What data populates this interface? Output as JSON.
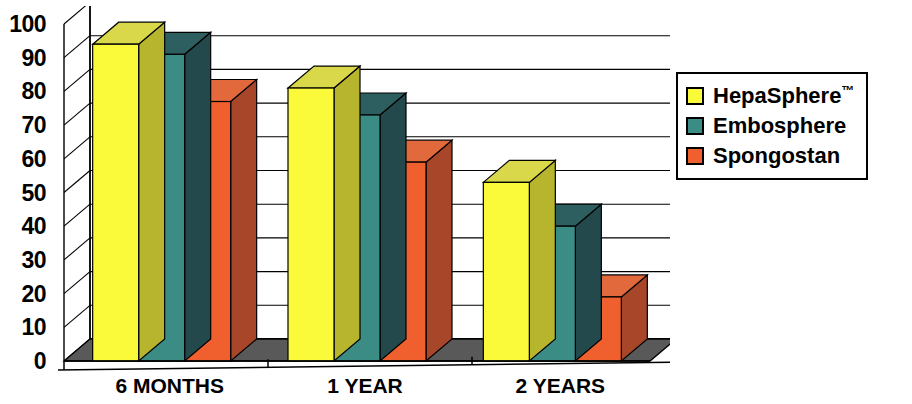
{
  "chart_data": {
    "type": "bar",
    "title": "",
    "subtitle": "",
    "xlabel": "",
    "ylabel": "",
    "categories": [
      "6 MONTHS",
      "1 YEAR",
      "2 YEARS"
    ],
    "series": [
      {
        "name": "HepaSphere™",
        "color": "#FAF93A",
        "values": [
          94,
          81,
          53
        ]
      },
      {
        "name": "Embosphere",
        "color": "#3C8C86",
        "values": [
          91,
          73,
          40
        ]
      },
      {
        "name": "Spongostan",
        "color": "#F0602E",
        "values": [
          77,
          59,
          19
        ]
      }
    ],
    "ylim": [
      0,
      100
    ],
    "ytick_step": 10,
    "yticks": [
      0,
      10,
      20,
      30,
      40,
      50,
      60,
      70,
      80,
      90,
      100
    ],
    "ytick_labels": [
      "0",
      "10",
      "20",
      "30",
      "40",
      "50",
      "60",
      "70",
      "80",
      "90",
      "100"
    ],
    "grid": true,
    "grid_axis": "y",
    "legend_position": "right",
    "three_d": true,
    "notes": ""
  },
  "legend": {
    "items": [
      {
        "label": "HepaSphere",
        "superscript": "™",
        "color": "#FAF93A",
        "swatch_name": "legend-swatch-hepasphere"
      },
      {
        "label": "Embosphere",
        "superscript": "",
        "color": "#3C8C86",
        "swatch_name": "legend-swatch-embosphere"
      },
      {
        "label": "Spongostan",
        "superscript": "",
        "color": "#F0602E",
        "swatch_name": "legend-swatch-spongostan"
      }
    ]
  },
  "colors": {
    "yellow": "#FAF93A",
    "yellow_top": "#D8D84A",
    "yellow_side": "#B7B52E",
    "teal": "#3C8C86",
    "teal_top": "#2E5F60",
    "teal_side": "#24494C",
    "orange": "#F0602E",
    "orange_top": "#E2693C",
    "orange_side": "#A8462A",
    "floor": "#595959",
    "axis": "#000000",
    "grid": "#000000",
    "background": "#FFFFFF"
  }
}
